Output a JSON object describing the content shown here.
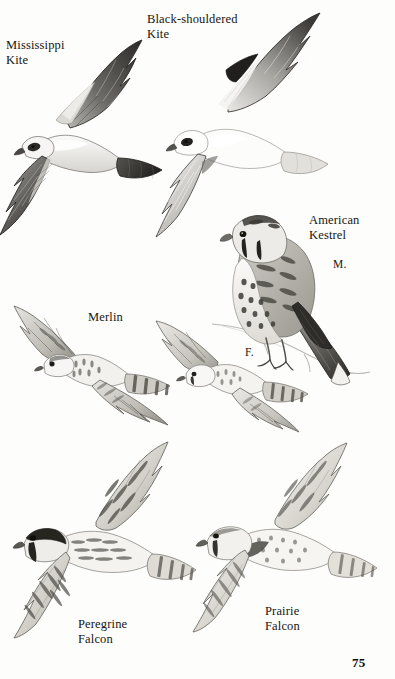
{
  "page": {
    "number": "75",
    "background_color": "#fdfdfc",
    "ink_color": "#17150f",
    "kind": "field-guide-plate"
  },
  "top_cropped_line": "",
  "plates": [
    {
      "id": "mississippi-kite",
      "label": "Mississippi\nKite",
      "label_x": 6,
      "label_y": 38,
      "pose": "flight-underside",
      "notes": "pale grey head and body, dark primaries and secondaries, squared dark tail"
    },
    {
      "id": "black-shouldered-kite",
      "label": "Black-shouldered\nKite",
      "label_x": 147,
      "label_y": 12,
      "pose": "flight-underside",
      "notes": "white body, black shoulder patch, pale grey wings, white tail"
    },
    {
      "id": "american-kestrel",
      "label": "American\nKestrel",
      "label_x": 309,
      "label_y": 213,
      "pose": "perched-on-branch",
      "sex": "M.",
      "sex_x": 333,
      "sex_y": 258,
      "notes": "rufous barred back, spotted buff breast, blue-grey wing, black malar stripes"
    },
    {
      "id": "merlin",
      "label": "Merlin",
      "label_x": 88,
      "label_y": 310,
      "pose": "flight-underside",
      "notes": "compact, heavily streaked underparts, banded tail"
    },
    {
      "id": "kestrel-female-flight",
      "label": "",
      "sex": "F.",
      "sex_x": 245,
      "sex_y": 346,
      "pose": "flight-underside",
      "notes": "female American Kestrel in flight, barred rufous tail"
    },
    {
      "id": "peregrine-falcon",
      "label": "Peregrine\nFalcon",
      "label_x": 78,
      "label_y": 617,
      "pose": "flight-underside",
      "notes": "dark hooded head, broad moustachial mark, densely barred underwings"
    },
    {
      "id": "prairie-falcon",
      "label": "Prairie\nFalcon",
      "label_x": 265,
      "label_y": 604,
      "pose": "flight-underside",
      "notes": "pale sandy tone, dark axillaries forming wingpit patch, narrow moustache"
    }
  ]
}
